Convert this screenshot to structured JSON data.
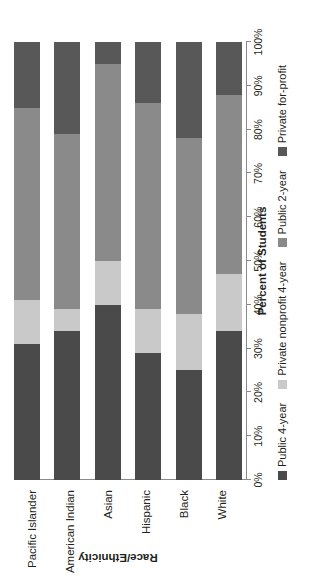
{
  "chart_data": {
    "type": "bar",
    "orientation": "horizontal",
    "stacked": true,
    "stack_mode": "percent",
    "title": "",
    "xlabel": "Percent of Students",
    "ylabel": "Race/Ethnicity",
    "xlim": [
      0,
      100
    ],
    "xticks": [
      0,
      10,
      20,
      30,
      40,
      50,
      60,
      70,
      80,
      90,
      100
    ],
    "xtick_labels": [
      "0%",
      "10%",
      "20%",
      "30%",
      "40%",
      "50%",
      "60%",
      "70%",
      "80%",
      "90%",
      "100%"
    ],
    "grid": false,
    "legend_position": "bottom",
    "categories": [
      "Pacific Islander",
      "American Indian",
      "Asian",
      "Hispanic",
      "Black",
      "White"
    ],
    "series": [
      {
        "name": "Public 4-year",
        "color": "#4a4a4a",
        "values": [
          31,
          34,
          40,
          29,
          25,
          34
        ]
      },
      {
        "name": "Private nonprofit 4-year",
        "color": "#c9c9c9",
        "values": [
          10,
          5,
          10,
          10,
          13,
          13
        ]
      },
      {
        "name": "Public 2-year",
        "color": "#8a8a8a",
        "values": [
          44,
          40,
          45,
          47,
          40,
          41
        ]
      },
      {
        "name": "Private for-profit",
        "color": "#585858",
        "values": [
          15,
          21,
          5,
          14,
          22,
          12
        ]
      }
    ]
  },
  "axis": {
    "value_axis_title": "Percent of Students",
    "category_axis_title": "Race/Ethnicity"
  },
  "colors": {
    "public_4_year": "#4a4a4a",
    "private_nonprofit_4_year": "#c9c9c9",
    "public_2_year": "#8a8a8a",
    "private_for_profit": "#585858",
    "axis": "#8a8a8a",
    "text": "#231f20",
    "background": "#ffffff"
  }
}
